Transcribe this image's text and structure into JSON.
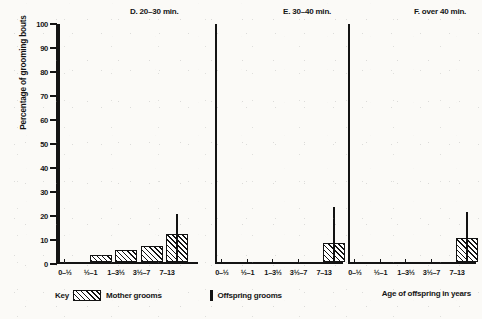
{
  "figure": {
    "ylabel": "Percentage of grooming bouts",
    "xtitle": "Age of offspring in years"
  },
  "legend": {
    "key_word": "Key",
    "mother_label": "Mother grooms",
    "offspring_label": "Offspring grooms",
    "mother_swatch_icon": "hatched-bar-icon",
    "offspring_swatch_icon": "solid-line-icon"
  },
  "yaxis": {
    "ticks": [
      "100",
      "90",
      "80",
      "70",
      "60",
      "50",
      "40",
      "30",
      "20",
      "10",
      "0"
    ]
  },
  "chart_data": {
    "type": "bar",
    "title": "",
    "xlabel": "Age of offspring in years",
    "ylabel": "Percentage of grooming bouts",
    "ylim": [
      0,
      100
    ],
    "ytick_step": 10,
    "grid": false,
    "legend_position": "bottom-left",
    "categories": [
      "0–½",
      "½–1",
      "1–3½",
      "3½–7",
      "7–13"
    ],
    "panels": [
      {
        "id": "D",
        "title": "D. 20–30 min.",
        "series": [
          {
            "name": "Mother grooms",
            "values": [
              0,
              3,
              5,
              7,
              12
            ]
          },
          {
            "name": "Offspring grooms",
            "values": [
              0,
              0,
              0,
              0,
              20
            ]
          }
        ]
      },
      {
        "id": "E",
        "title": "E. 30–40 min.",
        "series": [
          {
            "name": "Mother grooms",
            "values": [
              0,
              0,
              0,
              0,
              8
            ]
          },
          {
            "name": "Offspring grooms",
            "values": [
              0,
              0,
              0,
              0,
              23
            ]
          }
        ]
      },
      {
        "id": "F",
        "title": "F. over 40 min.",
        "series": [
          {
            "name": "Mother grooms",
            "values": [
              0,
              0,
              0,
              0,
              10
            ]
          },
          {
            "name": "Offspring grooms",
            "values": [
              0,
              0,
              0,
              0,
              21
            ]
          }
        ]
      }
    ]
  }
}
